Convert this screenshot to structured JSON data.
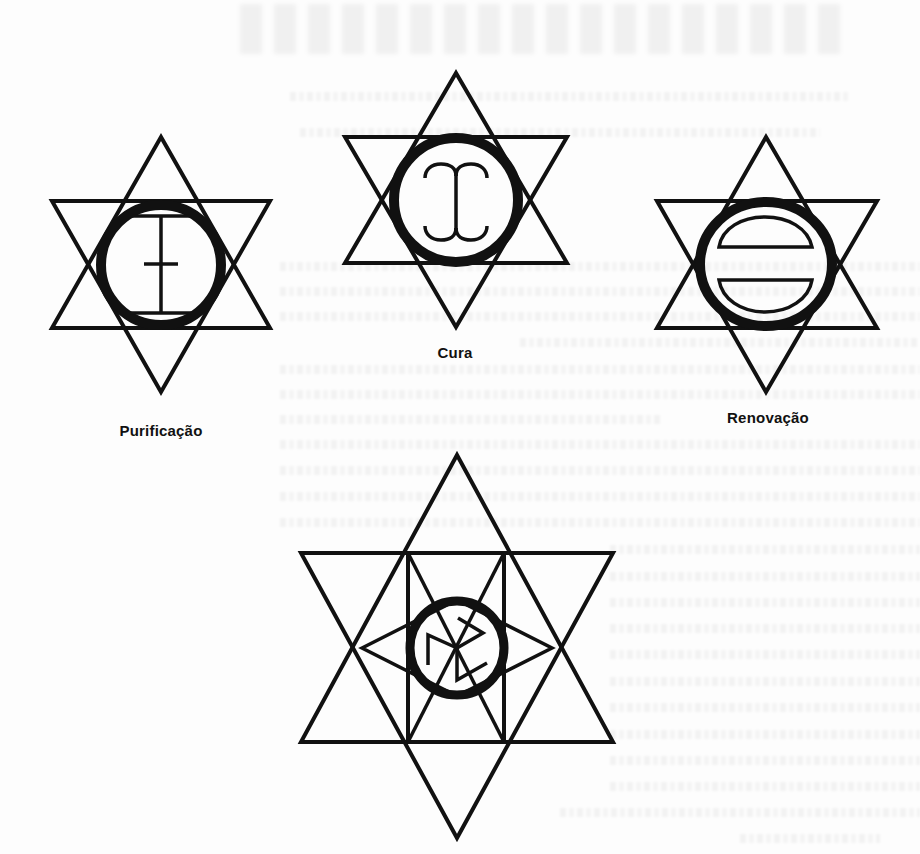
{
  "page": {
    "background": "#fdfdfd",
    "ink_color": "#111111"
  },
  "symbols": [
    {
      "id": "purificacao",
      "label": "Purificação",
      "label_position": {
        "x": 161,
        "y": 430
      },
      "inner_glyph": "cross-bar-between-chords"
    },
    {
      "id": "cura",
      "label": "Cura",
      "label_position": {
        "x": 455,
        "y": 352
      },
      "inner_glyph": "double-curl-stem"
    },
    {
      "id": "renovacao",
      "label": "Renovação",
      "label_position": {
        "x": 768,
        "y": 417
      },
      "inner_glyph": "two-half-discs"
    },
    {
      "id": "unlabeled",
      "label": "",
      "inner_glyph": "cube-rune"
    }
  ]
}
